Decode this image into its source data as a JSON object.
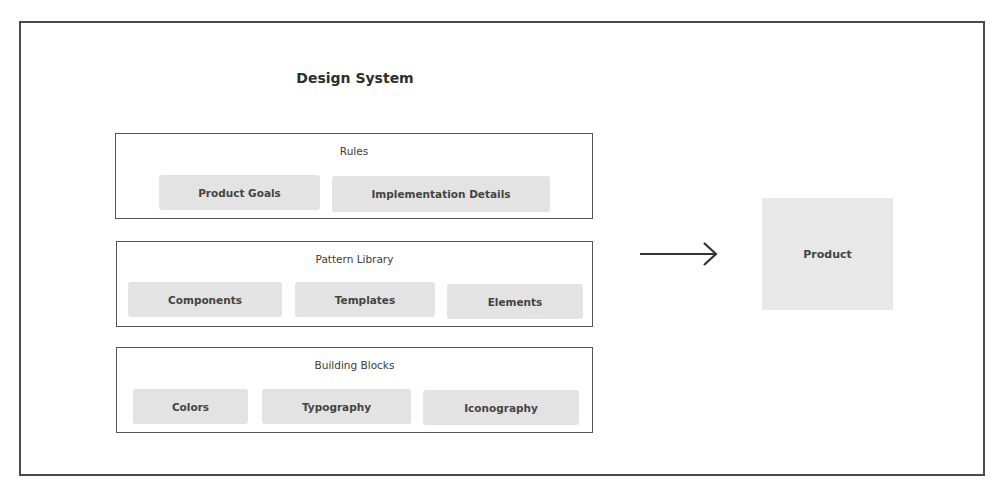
{
  "diagram": {
    "title": "Design System",
    "groups": [
      {
        "label": "Rules",
        "items": [
          "Product Goals",
          "Implementation Details"
        ]
      },
      {
        "label": "Pattern Library",
        "items": [
          "Components",
          "Templates",
          "Elements"
        ]
      },
      {
        "label": "Building Blocks",
        "items": [
          "Colors",
          "Typography",
          "Iconography"
        ]
      }
    ],
    "arrow_icon": "arrow-right-icon",
    "target": "Product"
  },
  "colors": {
    "frame_border": "#4a4a4a",
    "pill_bg": "#e3e3e3",
    "product_bg": "#e8e8e8",
    "text": "#333333"
  }
}
